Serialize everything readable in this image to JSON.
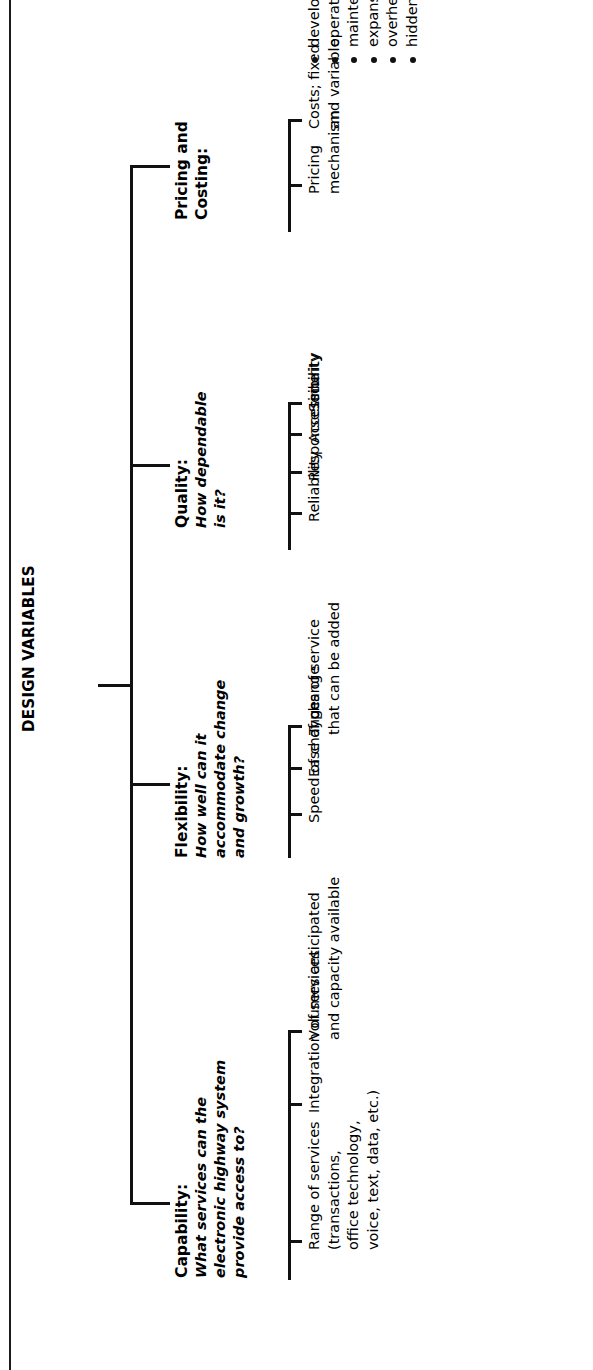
{
  "diagram": {
    "title": "DESIGN VARIABLES",
    "type": "tree",
    "orientation": "rotated-90-ccw",
    "line_color": "#111111",
    "background": "#ffffff",
    "branches": [
      {
        "id": "capability",
        "name": "Capability:",
        "question": [
          "What services can the",
          "electronic highway system",
          "provide access to?"
        ],
        "items": [
          {
            "lines": [
              "Range of services",
              "(transactions,",
              "office technology,",
              "voice, text, data, etc.)"
            ]
          },
          {
            "lines": [
              "Integration of services"
            ]
          },
          {
            "lines": [
              "Volumes anticipated",
              "and capacity available"
            ]
          }
        ]
      },
      {
        "id": "flexibility",
        "name": "Flexibility:",
        "question": [
          "How well can it",
          "accommodate change",
          "and growth?"
        ],
        "items": [
          {
            "lines": [
              "Speed of change"
            ]
          },
          {
            "lines": [
              "Ease of change"
            ]
          },
          {
            "lines": [
              "Types of service",
              "that can be added"
            ]
          }
        ]
      },
      {
        "id": "quality",
        "name": "Quality:",
        "question": [
          "How dependable",
          "is it?"
        ],
        "items": [
          {
            "lines": [
              "Reliability"
            ]
          },
          {
            "lines": [
              "Response time"
            ]
          },
          {
            "lines": [
              "Accessibility"
            ]
          },
          {
            "lines": [
              "Security"
            ]
          }
        ]
      },
      {
        "id": "pricing",
        "name": [
          "Pricing and",
          "Costing:"
        ],
        "question": [],
        "items": [
          {
            "lines": [
              "Pricing",
              "mechanism"
            ]
          },
          {
            "lines": [
              "Costs; fixed",
              "and variable:"
            ]
          }
        ],
        "bullets": [
          "development",
          "operations",
          "maintenance",
          "expansion",
          "overhead",
          "hidden"
        ]
      }
    ]
  }
}
